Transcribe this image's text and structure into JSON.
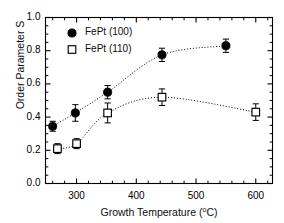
{
  "chart_data": {
    "type": "scatter",
    "title": "",
    "xlabel": "Growth Temperature (°C)",
    "ylabel": "Order Parameter S",
    "xlim": [
      248,
      628
    ],
    "ylim": [
      0.0,
      1.0
    ],
    "xticks": [
      300,
      400,
      500,
      600
    ],
    "xticklabels": [
      "300",
      "400",
      "500",
      "600"
    ],
    "yticks": [
      0.0,
      0.2,
      0.4,
      0.6,
      0.8,
      1.0
    ],
    "yticklabels": [
      "0.0",
      "0.2",
      "0.4",
      "0.6",
      "0.8",
      "1.0"
    ],
    "minor_ticks": true,
    "grid": false,
    "legend_position": "upper-left-inside",
    "trendline_style": "dotted",
    "series": [
      {
        "name": "FePt (100)",
        "marker": "filled-circle",
        "color": "#000000",
        "x": [
          260,
          298,
          352,
          443,
          550
        ],
        "values": [
          0.345,
          0.425,
          0.55,
          0.775,
          0.83
        ],
        "yerr": [
          0.03,
          0.05,
          0.04,
          0.04,
          0.04
        ]
      },
      {
        "name": "FePt (110)",
        "marker": "open-square",
        "color": "#000000",
        "x": [
          268,
          300,
          352,
          443,
          600
        ],
        "values": [
          0.21,
          0.24,
          0.425,
          0.52,
          0.43
        ],
        "yerr": [
          0.03,
          0.03,
          0.06,
          0.05,
          0.05
        ]
      }
    ]
  },
  "legend": {
    "entries": [
      {
        "label": "FePt (100)",
        "marker": "filled-circle"
      },
      {
        "label": "FePt (110)",
        "marker": "open-square"
      }
    ]
  },
  "axes": {
    "x_label_text": "Growth Temperature (",
    "x_label_unit_sup": "o",
    "x_label_unit_tail": "C)",
    "y_label_text": "Order Parameter S"
  }
}
